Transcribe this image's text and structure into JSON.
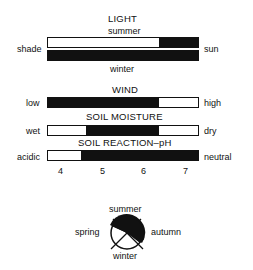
{
  "light": {
    "title": "LIGHT",
    "top_label": "summer",
    "bottom_label": "winter",
    "left_label": "shade",
    "right_label": "sun",
    "summer_fill": {
      "start": 0.74,
      "end": 1.0
    },
    "winter_fill": {
      "start": 0.0,
      "end": 1.0
    }
  },
  "wind": {
    "title": "WIND",
    "left_label": "low",
    "right_label": "high",
    "fill": {
      "start": 0.0,
      "end": 0.74
    }
  },
  "soil_moisture": {
    "title": "SOIL MOISTURE",
    "left_label": "wet",
    "right_label": "dry",
    "fill": {
      "start": 0.25,
      "end": 0.74
    }
  },
  "soil_ph": {
    "title": "SOIL REACTION–pH",
    "left_label": "acidic",
    "right_label": "neutral",
    "fill": {
      "start": 0.22,
      "end": 1.0
    },
    "ticks": [
      "4",
      "5",
      "6",
      "7"
    ]
  },
  "seasons": {
    "top": "summer",
    "left": "spring",
    "right": "autumn",
    "bottom": "winter"
  },
  "colors": {
    "fill": "#111111",
    "background": "#ffffff"
  }
}
